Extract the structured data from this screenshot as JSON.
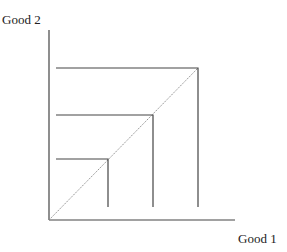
{
  "diagram": {
    "type": "indifference-curves-perfect-complements",
    "axes": {
      "y_label": "Good 2",
      "x_label": "Good 1",
      "origin": [
        49,
        220
      ],
      "y_axis_top": 30,
      "x_axis_right": 235,
      "color": "#444444"
    },
    "diagonal": {
      "from": [
        49,
        220
      ],
      "to": [
        198,
        68
      ],
      "color": "#888888",
      "style": "dotted"
    },
    "curves": [
      {
        "name": "inner",
        "corner": [
          108,
          159
        ],
        "h_start_x": 56,
        "v_end_y": 207
      },
      {
        "name": "middle",
        "corner": [
          153,
          115
        ],
        "h_start_x": 56,
        "v_end_y": 207
      },
      {
        "name": "outer",
        "corner": [
          198,
          68
        ],
        "h_start_x": 56,
        "v_end_y": 207
      }
    ],
    "line_color": "#444444"
  }
}
